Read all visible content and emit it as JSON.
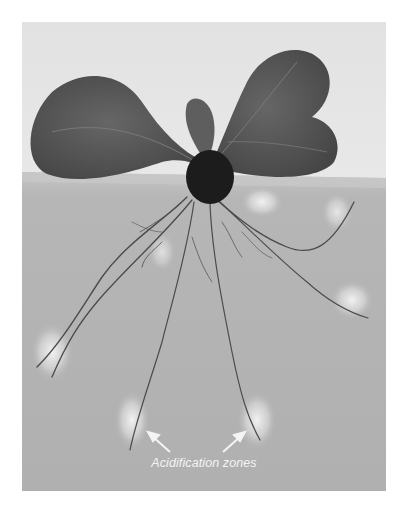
{
  "figure": {
    "annotation": {
      "label": "Acidification zones",
      "arrows": 2
    },
    "colors": {
      "upper_background": "#e4e4e4",
      "medium": "#b3b3b3",
      "leaf": "#5a5a5a",
      "seed": "#1c1c1c",
      "root": "#4a4a4a",
      "glow": "#f4f4f4",
      "label": "#f4f4f4"
    }
  }
}
